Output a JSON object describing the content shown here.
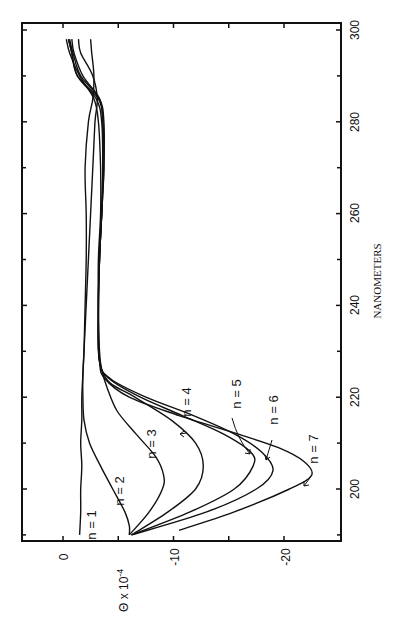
{
  "chart_data": {
    "type": "line",
    "title": "",
    "orientation": "rotated 90deg counter-clockwise",
    "xlabel": "NANOMETERS",
    "ylabel": "Θ x 10^-4",
    "xlim": [
      188,
      301
    ],
    "ylim": [
      -24,
      2
    ],
    "x_ticks": [
      200,
      220,
      240,
      260,
      280,
      300
    ],
    "x_tick_labels": [
      "200",
      "220",
      "240",
      "260",
      "280",
      "300"
    ],
    "y_ticks": [
      0,
      -10,
      -20
    ],
    "y_tick_labels": [
      "0",
      "-10",
      "-20"
    ],
    "grid": false,
    "legend": "inline annotations n = 1 ... n = 7",
    "series": [
      {
        "name": "n = 1",
        "x": [
          190,
          195,
          200,
          205,
          210,
          215,
          220,
          225,
          230,
          240,
          250,
          260,
          270,
          280,
          285,
          290,
          295,
          298
        ],
        "y": [
          -1.5,
          -1.6,
          -1.6,
          -1.7,
          -1.6,
          -1.7,
          -1.7,
          -1.8,
          -1.9,
          -2.0,
          -2.1,
          -2.1,
          -2.0,
          -2.3,
          -2.7,
          -2.8,
          -2.6,
          -2.5
        ]
      },
      {
        "name": "n = 2",
        "x": [
          190,
          192,
          195,
          200,
          205,
          210,
          215,
          220,
          225,
          230,
          240,
          250,
          260,
          270,
          280,
          285,
          290,
          295,
          298
        ],
        "y": [
          -6.0,
          -6.0,
          -5.6,
          -4.5,
          -3.4,
          -2.4,
          -1.9,
          -1.8,
          -1.8,
          -1.9,
          -2.1,
          -2.3,
          -2.5,
          -2.7,
          -2.9,
          -3.1,
          -2.7,
          -1.6,
          -1.4
        ]
      },
      {
        "name": "n = 3",
        "x": [
          190,
          195,
          200,
          203,
          207,
          212,
          217,
          222,
          226,
          230,
          240,
          250,
          260,
          270,
          280,
          285,
          290,
          295,
          298
        ],
        "y": [
          -6.0,
          -7.8,
          -9.0,
          -9.1,
          -8.4,
          -6.6,
          -4.9,
          -4.0,
          -3.5,
          -3.3,
          -3.2,
          -3.2,
          -3.4,
          -3.4,
          -3.2,
          -2.8,
          -1.5,
          -0.6,
          -0.3
        ]
      },
      {
        "name": "n = 4",
        "x": [
          190,
          195,
          200,
          205,
          210,
          215,
          220,
          223,
          226,
          230,
          240,
          250,
          260,
          270,
          280,
          285,
          290,
          295,
          298
        ],
        "y": [
          -6.2,
          -9.5,
          -12.0,
          -12.7,
          -12.0,
          -9.8,
          -6.5,
          -4.3,
          -3.5,
          -3.2,
          -3.2,
          -3.3,
          -3.5,
          -3.6,
          -3.6,
          -3.3,
          -1.8,
          -1.0,
          -0.8
        ]
      },
      {
        "name": "n = 5",
        "x": [
          190,
          195,
          200,
          205,
          208,
          212,
          216,
          220,
          224,
          228,
          240,
          250,
          260,
          270,
          280,
          285,
          290,
          295,
          298
        ],
        "y": [
          -6.2,
          -11.5,
          -15.5,
          -17.2,
          -17.0,
          -14.5,
          -10.8,
          -7.0,
          -4.2,
          -3.3,
          -3.2,
          -3.3,
          -3.5,
          -3.7,
          -3.6,
          -3.2,
          -1.3,
          -0.8,
          -0.5
        ]
      },
      {
        "name": "n = 6",
        "x": [
          190,
          195,
          200,
          204,
          208,
          212,
          216,
          220,
          224,
          228,
          240,
          250,
          260,
          270,
          280,
          285,
          290,
          295,
          298
        ],
        "y": [
          -6.2,
          -13.0,
          -17.5,
          -19.0,
          -18.0,
          -15.5,
          -11.8,
          -7.5,
          -4.3,
          -3.3,
          -3.2,
          -3.3,
          -3.5,
          -3.7,
          -3.7,
          -3.3,
          -1.6,
          -0.9,
          -0.6
        ]
      },
      {
        "name": "n = 7",
        "x": [
          191,
          195,
          200,
          203,
          206,
          209,
          212,
          216,
          220,
          224,
          228,
          240,
          250,
          260,
          270,
          280,
          285,
          290,
          295,
          298
        ],
        "y": [
          -10.5,
          -15.5,
          -20.5,
          -22.5,
          -21.8,
          -19.5,
          -15.8,
          -10.5,
          -6.0,
          -3.8,
          -3.3,
          -3.2,
          -3.3,
          -3.5,
          -3.6,
          -3.5,
          -3.0,
          -1.3,
          -0.8,
          -0.5
        ]
      }
    ],
    "annotations": [
      {
        "text": "n = 1",
        "lambda": 192,
        "theta": -2.0
      },
      {
        "text": "n = 2",
        "lambda": 195,
        "theta": -4.6
      },
      {
        "text": "n = 3",
        "lambda": 197,
        "theta": -7.2
      },
      {
        "text": "n = 4",
        "lambda": 211,
        "theta": -10.5,
        "arrow": true
      },
      {
        "text": "n = 5",
        "lambda": 211,
        "theta": -15.6,
        "arrow": true
      },
      {
        "text": "n = 6",
        "lambda": 210,
        "theta": -18.7,
        "arrow": true
      },
      {
        "text": "n = 7",
        "lambda": 206,
        "theta": -23.0,
        "arrow": true
      }
    ]
  },
  "axes": {
    "xlabel": "NANOMETERS",
    "ylabel_main": "Θ x 10",
    "ylabel_exp": "-4",
    "x_tick_labels": [
      "200",
      "220",
      "240",
      "260",
      "280",
      "300"
    ],
    "y_tick_labels": [
      "0",
      "-10",
      "-20"
    ]
  },
  "labels": {
    "n1": "n = 1",
    "n2": "n = 2",
    "n3": "n = 3",
    "n4": "n = 4",
    "n5": "n = 5",
    "n6": "n = 6",
    "n7": "n = 7"
  }
}
